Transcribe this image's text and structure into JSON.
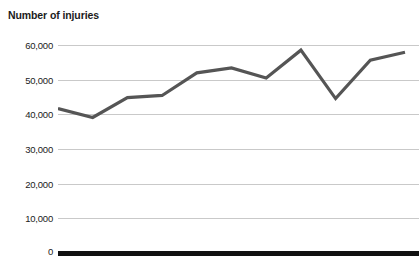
{
  "chart_data": {
    "type": "line",
    "title": "Number of injuries",
    "xlabel": "",
    "ylabel": "",
    "ylim": [
      0,
      60000
    ],
    "grid": true,
    "legend": "none",
    "yticks": [
      "60,000",
      "50,000",
      "40,000",
      "30,000",
      "20,000",
      "10,000",
      "0"
    ],
    "ytick_values": [
      60000,
      50000,
      40000,
      30000,
      20000,
      10000,
      0
    ],
    "series": [
      {
        "name": "Number of injuries",
        "color": "#555555",
        "values": [
          41500,
          38900,
          44700,
          45300,
          51900,
          53300,
          50400,
          58500,
          44400,
          55600,
          57900
        ]
      }
    ],
    "x": [
      0,
      1,
      2,
      3,
      4,
      5,
      6,
      7,
      8,
      9,
      10
    ],
    "axis_color": "#111111",
    "grid_color": "#c9c9c9"
  }
}
